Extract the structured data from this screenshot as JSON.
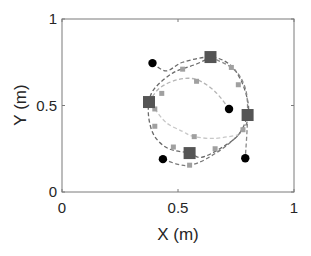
{
  "chart_data": {
    "type": "scatter",
    "title": "",
    "xlabel": "X (m)",
    "ylabel": "Y (m)",
    "xlim": [
      0,
      1
    ],
    "ylim": [
      0,
      1
    ],
    "xticks": [
      0,
      0.5,
      1
    ],
    "yticks": [
      0,
      0.5,
      1
    ],
    "xtick_labels": [
      "0",
      "0.5",
      "1"
    ],
    "ytick_labels": [
      "0",
      "0.5",
      "1"
    ],
    "grid": false,
    "legend": null,
    "series": [
      {
        "name": "targets (squares)",
        "marker": "square",
        "color": "#555555",
        "points": [
          {
            "x": 0.375,
            "y": 0.52
          },
          {
            "x": 0.64,
            "y": 0.78
          },
          {
            "x": 0.8,
            "y": 0.445
          },
          {
            "x": 0.55,
            "y": 0.225
          }
        ]
      },
      {
        "name": "start positions (black circles)",
        "marker": "circle",
        "color": "#000000",
        "points": [
          {
            "x": 0.39,
            "y": 0.745
          },
          {
            "x": 0.72,
            "y": 0.48
          },
          {
            "x": 0.79,
            "y": 0.195
          },
          {
            "x": 0.435,
            "y": 0.19
          }
        ]
      },
      {
        "name": "trajectory outer loop A",
        "line": "dashed",
        "color": "#6a6a6a",
        "points": [
          {
            "x": 0.39,
            "y": 0.745
          },
          {
            "x": 0.45,
            "y": 0.7
          },
          {
            "x": 0.52,
            "y": 0.75
          },
          {
            "x": 0.64,
            "y": 0.78
          },
          {
            "x": 0.72,
            "y": 0.74
          },
          {
            "x": 0.77,
            "y": 0.65
          },
          {
            "x": 0.8,
            "y": 0.53
          },
          {
            "x": 0.8,
            "y": 0.445
          },
          {
            "x": 0.76,
            "y": 0.33
          },
          {
            "x": 0.68,
            "y": 0.25
          },
          {
            "x": 0.6,
            "y": 0.2
          },
          {
            "x": 0.55,
            "y": 0.225
          },
          {
            "x": 0.46,
            "y": 0.25
          },
          {
            "x": 0.4,
            "y": 0.32
          },
          {
            "x": 0.375,
            "y": 0.42
          },
          {
            "x": 0.375,
            "y": 0.52
          },
          {
            "x": 0.4,
            "y": 0.6
          },
          {
            "x": 0.48,
            "y": 0.69
          },
          {
            "x": 0.58,
            "y": 0.74
          },
          {
            "x": 0.64,
            "y": 0.78
          }
        ]
      },
      {
        "name": "trajectory outer loop B",
        "line": "dashed",
        "color": "#8a8a8a",
        "points": [
          {
            "x": 0.64,
            "y": 0.78
          },
          {
            "x": 0.74,
            "y": 0.71
          },
          {
            "x": 0.79,
            "y": 0.6
          },
          {
            "x": 0.8,
            "y": 0.445
          },
          {
            "x": 0.79,
            "y": 0.195
          }
        ]
      },
      {
        "name": "trajectory lower loop",
        "line": "dashed",
        "color": "#7a7a7a",
        "points": [
          {
            "x": 0.435,
            "y": 0.19
          },
          {
            "x": 0.5,
            "y": 0.16
          },
          {
            "x": 0.55,
            "y": 0.155
          },
          {
            "x": 0.62,
            "y": 0.19
          },
          {
            "x": 0.72,
            "y": 0.28
          },
          {
            "x": 0.79,
            "y": 0.38
          },
          {
            "x": 0.8,
            "y": 0.445
          }
        ]
      },
      {
        "name": "trajectory inner loop",
        "line": "dashed",
        "color": "#b5b5b5",
        "points": [
          {
            "x": 0.375,
            "y": 0.52
          },
          {
            "x": 0.42,
            "y": 0.6
          },
          {
            "x": 0.5,
            "y": 0.65
          },
          {
            "x": 0.58,
            "y": 0.65
          },
          {
            "x": 0.66,
            "y": 0.58
          },
          {
            "x": 0.72,
            "y": 0.48
          }
        ]
      },
      {
        "name": "trajectory inner lower",
        "line": "dashed",
        "color": "#c8c8c8",
        "points": [
          {
            "x": 0.4,
            "y": 0.48
          },
          {
            "x": 0.45,
            "y": 0.4
          },
          {
            "x": 0.52,
            "y": 0.35
          },
          {
            "x": 0.57,
            "y": 0.32
          },
          {
            "x": 0.66,
            "y": 0.31
          },
          {
            "x": 0.76,
            "y": 0.33
          }
        ]
      },
      {
        "name": "intermediate points",
        "marker": "small-square",
        "color": "#a0a0a0",
        "points": [
          {
            "x": 0.52,
            "y": 0.71
          },
          {
            "x": 0.58,
            "y": 0.64
          },
          {
            "x": 0.73,
            "y": 0.72
          },
          {
            "x": 0.76,
            "y": 0.62
          },
          {
            "x": 0.4,
            "y": 0.48
          },
          {
            "x": 0.4,
            "y": 0.38
          },
          {
            "x": 0.57,
            "y": 0.32
          },
          {
            "x": 0.55,
            "y": 0.155
          },
          {
            "x": 0.66,
            "y": 0.25
          },
          {
            "x": 0.78,
            "y": 0.36
          },
          {
            "x": 0.43,
            "y": 0.57
          },
          {
            "x": 0.48,
            "y": 0.26
          }
        ]
      }
    ]
  }
}
